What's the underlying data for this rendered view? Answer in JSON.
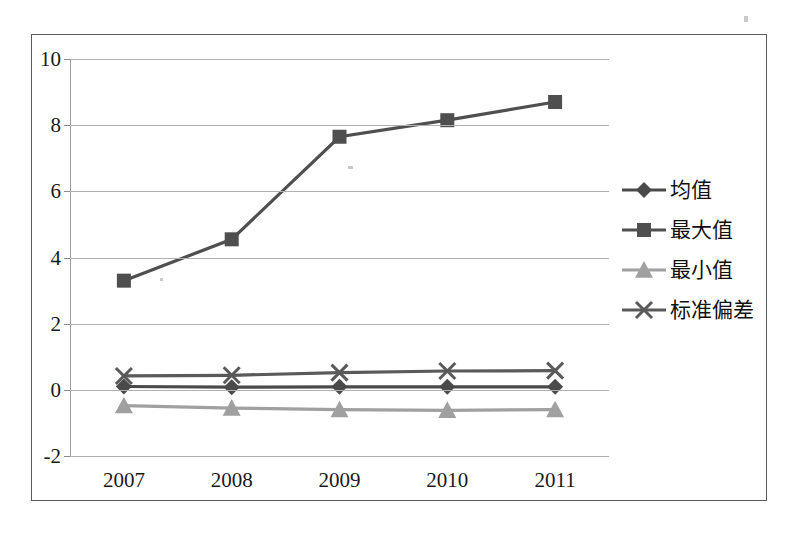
{
  "chart_data": {
    "type": "line",
    "title": "",
    "xlabel": "",
    "ylabel": "",
    "categories": [
      "2007",
      "2008",
      "2009",
      "2010",
      "2011"
    ],
    "ylim": [
      -2,
      10
    ],
    "yticks": [
      -2,
      0,
      2,
      4,
      6,
      8,
      10
    ],
    "ytick_labels": [
      "-2",
      "0",
      "2",
      "4",
      "6",
      "8",
      "10"
    ],
    "grid": true,
    "legend_position": "right",
    "series": [
      {
        "name": "均值",
        "marker": "diamond",
        "color": "#4a4a4a",
        "values": [
          0.1,
          0.08,
          0.09,
          0.09,
          0.09
        ]
      },
      {
        "name": "最大值",
        "marker": "square",
        "color": "#4f4f4f",
        "values": [
          3.3,
          4.55,
          7.65,
          8.15,
          8.7
        ]
      },
      {
        "name": "最小值",
        "marker": "triangle",
        "color": "#a0a0a0",
        "values": [
          -0.48,
          -0.55,
          -0.6,
          -0.62,
          -0.6
        ]
      },
      {
        "name": "标准偏差",
        "marker": "cross",
        "color": "#5a5a5a",
        "values": [
          0.42,
          0.44,
          0.52,
          0.57,
          0.58
        ]
      }
    ]
  },
  "legend": {
    "items": [
      {
        "label": "均值",
        "marker": "diamond",
        "color": "#4a4a4a"
      },
      {
        "label": "最大值",
        "marker": "square",
        "color": "#4f4f4f"
      },
      {
        "label": "最小值",
        "marker": "triangle",
        "color": "#a0a0a0"
      },
      {
        "label": "标准偏差",
        "marker": "cross",
        "color": "#5a5a5a"
      }
    ]
  },
  "style": {
    "frame_color": "#5c5c5c",
    "gridline_color": "#b0b0b0",
    "background": "#ffffff",
    "text_color": "#1a1a1a"
  }
}
